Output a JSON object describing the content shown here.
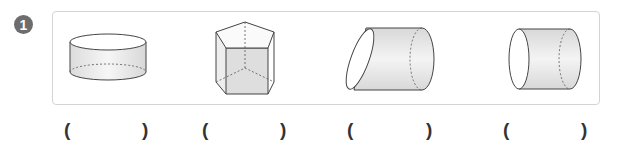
{
  "problem": {
    "number": "1",
    "shapes": [
      {
        "id": "short-cylinder",
        "label": "cylinder (upright, short)"
      },
      {
        "id": "pentagonal-prism",
        "label": "pentagonal prism"
      },
      {
        "id": "oblique-cylinder",
        "label": "cylinder with slanted face (lying)"
      },
      {
        "id": "horizontal-cylinder",
        "label": "cylinder (lying)"
      }
    ],
    "answers": [
      {
        "open": "(",
        "close": ")",
        "value": ""
      },
      {
        "open": "(",
        "close": ")",
        "value": ""
      },
      {
        "open": "(",
        "close": ")",
        "value": ""
      },
      {
        "open": "(",
        "close": ")",
        "value": ""
      }
    ]
  }
}
